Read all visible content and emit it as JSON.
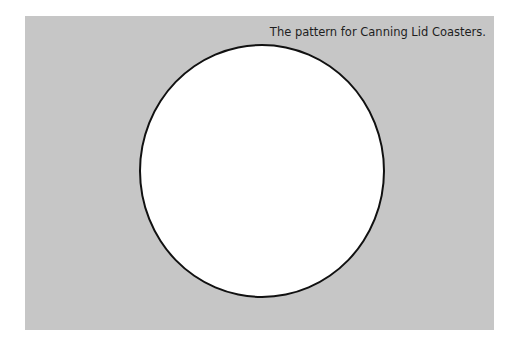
{
  "figure": {
    "caption": "The pattern for Canning Lid Coasters.",
    "shape": "circle-outline",
    "colors": {
      "background": "#c6c6c6",
      "circle_fill": "#ffffff",
      "circle_stroke": "#111111"
    }
  }
}
